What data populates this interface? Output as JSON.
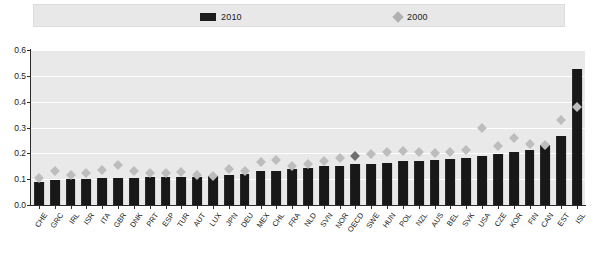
{
  "legend": {
    "entries": [
      {
        "label": "2010",
        "marker": "bar-swatch-icon",
        "color": "#1c1c1c"
      },
      {
        "label": "2000",
        "marker": "diamond-swatch-icon",
        "color": "#b0b0b0"
      }
    ]
  },
  "axis": {
    "y_ticks": [
      "0.0",
      "0.1",
      "0.2",
      "0.3",
      "0.4",
      "0.5",
      "0.6"
    ]
  },
  "chart_data": {
    "type": "bar",
    "title": "",
    "xlabel": "",
    "ylabel": "",
    "ylim": [
      0.0,
      0.6
    ],
    "grid": true,
    "legend_position": "top",
    "highlight_category": "OECD",
    "categories": [
      "CHE",
      "GRC",
      "IRL",
      "ISR",
      "ITA",
      "GBR",
      "DNK",
      "PRT",
      "ESP",
      "TUR",
      "AUT",
      "LUX",
      "JPN",
      "DEU",
      "MEX",
      "CHL",
      "FRA",
      "NLD",
      "SVN",
      "NOR",
      "OECD",
      "SWE",
      "HUN",
      "POL",
      "NZL",
      "AUS",
      "BEL",
      "SVK",
      "USA",
      "CZE",
      "KOR",
      "FIN",
      "CAN",
      "EST",
      "ISL"
    ],
    "series": [
      {
        "name": "2010",
        "type": "bar",
        "color": "#181818",
        "values": [
          0.09,
          0.098,
          0.1,
          0.101,
          0.103,
          0.104,
          0.106,
          0.107,
          0.108,
          0.109,
          0.11,
          0.112,
          0.118,
          0.12,
          0.131,
          0.133,
          0.14,
          0.143,
          0.15,
          0.152,
          0.158,
          0.16,
          0.163,
          0.17,
          0.172,
          0.175,
          0.18,
          0.183,
          0.19,
          0.196,
          0.205,
          0.214,
          0.232,
          0.268,
          0.528
        ]
      },
      {
        "name": "2000",
        "type": "scatter",
        "color": "#bdbdbd",
        "values": [
          0.105,
          0.131,
          0.118,
          0.122,
          0.135,
          0.155,
          0.13,
          0.125,
          0.122,
          0.127,
          0.118,
          0.112,
          0.14,
          0.133,
          0.165,
          0.175,
          0.152,
          0.16,
          0.172,
          0.182,
          0.19,
          0.196,
          0.205,
          0.208,
          0.205,
          0.2,
          0.205,
          0.213,
          0.3,
          0.228,
          0.26,
          0.238,
          0.232,
          0.33,
          0.38
        ]
      }
    ]
  }
}
